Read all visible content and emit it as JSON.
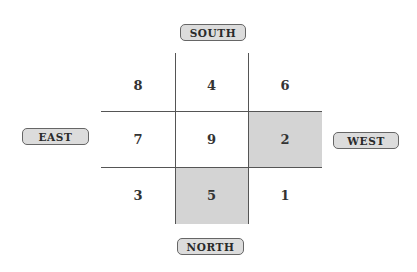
{
  "diagram": {
    "type": "lo-shu-magic-square-grid",
    "directions": {
      "top": "SOUTH",
      "left": "EAST",
      "right": "WEST",
      "bottom": "NORTH"
    },
    "grid": [
      [
        "8",
        "4",
        "6"
      ],
      [
        "7",
        "9",
        "2"
      ],
      [
        "3",
        "5",
        "1"
      ]
    ],
    "shaded_cells": [
      "2",
      "5"
    ],
    "colors": {
      "shade": "#d4d4d4",
      "label_fill": "#dcdcdc",
      "line": "#555555"
    }
  }
}
